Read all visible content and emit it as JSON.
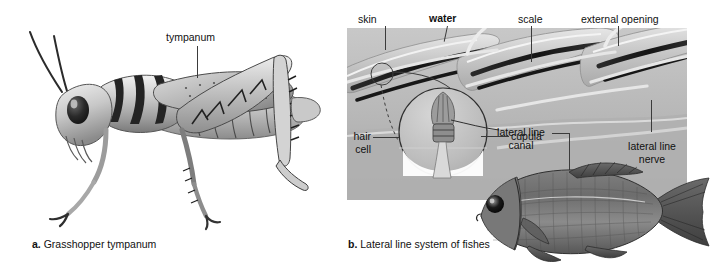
{
  "figure": {
    "background_color": "#ffffff",
    "panels": [
      {
        "id": "a",
        "letter": "a.",
        "caption": "Grasshopper tympanum",
        "caption_full": "a. Grasshopper tympanum",
        "subject": "grasshopper",
        "labels": [
          {
            "name": "tympanum",
            "text": "tympanum",
            "bold": false,
            "x": 166,
            "y": 34
          }
        ]
      },
      {
        "id": "b",
        "letter": "b.",
        "caption": "Lateral line system of fishes",
        "caption_full": "b. Lateral line system of fishes",
        "subject": "fish-lateral-line",
        "labels": [
          {
            "name": "skin",
            "text": "skin",
            "bold": false
          },
          {
            "name": "water",
            "text": "water",
            "bold": true
          },
          {
            "name": "scale",
            "text": "scale",
            "bold": false
          },
          {
            "name": "external-opening",
            "text": "external opening",
            "bold": false
          },
          {
            "name": "hair-cell",
            "text": "hair cell",
            "line1": "hair",
            "line2": "cell",
            "bold": false
          },
          {
            "name": "cupula",
            "text": "cupula",
            "bold": false
          },
          {
            "name": "lateral-line-canal",
            "text": "lateral line canal",
            "line1": "lateral line",
            "line2": "canal",
            "bold": false
          },
          {
            "name": "lateral-line-nerve",
            "text": "lateral line nerve",
            "line1": "lateral line",
            "line2": "nerve",
            "bold": false
          }
        ]
      }
    ],
    "colors": {
      "text": "#111111",
      "leader_line": "#3b3b3b",
      "cutaway_light": "#cfcfcf",
      "cutaway_mid": "#bcbcbc",
      "cutaway_dark": "#8a8a8a",
      "canal_dark": "#1d1d1d",
      "fish_body": "#6f6f6f",
      "grasshopper_body": "#9a9a9a"
    }
  },
  "panel_a": {
    "label_tympanum": "tympanum",
    "caption_letter": "a.",
    "caption_text": "Grasshopper tympanum"
  },
  "panel_b": {
    "label_skin": "skin",
    "label_water": "water",
    "label_scale": "scale",
    "label_external_opening": "external opening",
    "label_hair_line1": "hair",
    "label_hair_line2": "cell",
    "label_cupula": "cupula",
    "label_canal_line1": "lateral line",
    "label_canal_line2": "canal",
    "label_nerve_line1": "lateral line",
    "label_nerve_line2": "nerve",
    "caption_letter": "b.",
    "caption_text": "Lateral line system of fishes"
  }
}
